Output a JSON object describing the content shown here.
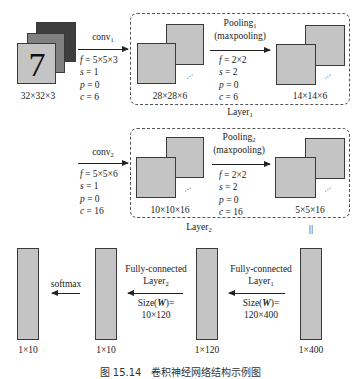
{
  "input": {
    "digit": "7",
    "size": "32×32×3"
  },
  "conv1": {
    "name": "conv",
    "sub": "1",
    "f": "5×5×3",
    "s": "1",
    "p": "0",
    "c": "6"
  },
  "layer1": {
    "label": "Layer",
    "sub": "1",
    "conv_output_size": "28×28×6",
    "pool": {
      "name": "Pooling",
      "sub": "1",
      "type": "(maxpooling)",
      "f": "2×2",
      "s": "2",
      "p": "0",
      "c": "6"
    },
    "pool_output_size": "14×14×6"
  },
  "conv2": {
    "name": "conv",
    "sub": "2",
    "f": "5×5×6",
    "s": "1",
    "p": "0",
    "c": "16"
  },
  "layer2": {
    "label": "Layer",
    "sub": "2",
    "conv_output_size": "10×10×16",
    "pool": {
      "name": "Pooling",
      "sub": "2",
      "type": "(maxpooling)",
      "f": "2×2",
      "s": "2",
      "p": "0",
      "c": "16"
    },
    "pool_output_size": "5×5×16"
  },
  "equivalence_mark": "||",
  "fully_connected": {
    "fc1": {
      "line1": "Fully-connected",
      "line2": "Layer",
      "sub": "1",
      "size_label": "Size(",
      "size_var": "W",
      "size_suffix": ")=",
      "size_value": "120×400"
    },
    "fc2": {
      "line1": "Fully-connected",
      "line2": "Layer",
      "sub": "2",
      "size_label": "Size(",
      "size_var": "W",
      "size_suffix": ")=",
      "size_value": "10×120"
    },
    "softmax": "softmax"
  },
  "vectors": [
    {
      "id": "out",
      "size": "1×10"
    },
    {
      "id": "fc2",
      "size": "1×10"
    },
    {
      "id": "fc1",
      "size": "1×120"
    },
    {
      "id": "flat",
      "size": "1×400"
    }
  ],
  "param_labels": {
    "f": "f",
    "s": "s",
    "p": "p",
    "c": "c",
    "eq": " = "
  },
  "caption": "图 15.14　卷积神经网络结构示例图"
}
